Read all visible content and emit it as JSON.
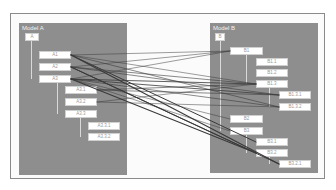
{
  "diagram": {
    "model_a": {
      "title": "Model A",
      "nodes": [
        {
          "id": "A",
          "label": "A"
        },
        {
          "id": "A1",
          "label": "A1"
        },
        {
          "id": "A2",
          "label": "A2"
        },
        {
          "id": "A3",
          "label": "A3"
        },
        {
          "id": "A3.1",
          "label": "A3.1"
        },
        {
          "id": "A3.2",
          "label": "A3.2"
        },
        {
          "id": "A3.3",
          "label": "A3.3"
        },
        {
          "id": "A3.3.1",
          "label": "A3.3.1"
        },
        {
          "id": "A3.3.2",
          "label": "A3.3.2"
        }
      ]
    },
    "model_b": {
      "title": "Model B",
      "nodes": [
        {
          "id": "B",
          "label": "B"
        },
        {
          "id": "B1",
          "label": "B1"
        },
        {
          "id": "B1.1",
          "label": "B1.1"
        },
        {
          "id": "B1.2",
          "label": "B1.2"
        },
        {
          "id": "B1.3",
          "label": "B1.3"
        },
        {
          "id": "B1.3.1",
          "label": "B1.3.1"
        },
        {
          "id": "B1.3.2",
          "label": "B1.3.2"
        },
        {
          "id": "B2",
          "label": "B2"
        },
        {
          "id": "B3",
          "label": "B3"
        },
        {
          "id": "B3.1",
          "label": "B3.1"
        },
        {
          "id": "B3.2",
          "label": "B3.2"
        },
        {
          "id": "B3.2.1",
          "label": "B3.2.1"
        }
      ]
    },
    "colors": {
      "panel": "#8e8e8e",
      "node": "#ffffff",
      "link": "#3a3a3a"
    }
  }
}
